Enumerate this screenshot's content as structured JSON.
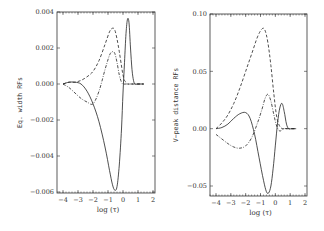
{
  "chart_data": [
    {
      "type": "line",
      "title": "",
      "xlabel": "log (τ)",
      "ylabel": "Eq. width RFs",
      "xlim": [
        -4.4,
        2
      ],
      "ylim": [
        -0.006,
        0.004
      ],
      "xticks": [
        -4,
        -3,
        -2,
        -1,
        0,
        1,
        2
      ],
      "xtick_labels": [
        "−4",
        "−3",
        "−2",
        "−1",
        "0",
        "1",
        "2"
      ],
      "yticks": [
        0.004,
        0.002,
        0.0,
        -0.002,
        -0.004,
        -0.006
      ],
      "ytick_labels": [
        "0.004",
        "0.002",
        "0.000",
        "−0.002",
        "−0.004",
        "−0.006"
      ],
      "grid": false,
      "legend": null,
      "series": [
        {
          "name": "solid",
          "style": "solid",
          "x": [
            -4.0,
            -3.6,
            -3.2,
            -2.8,
            -2.4,
            -2.0,
            -1.6,
            -1.2,
            -0.9,
            -0.7,
            -0.55,
            -0.4,
            -0.25,
            -0.1,
            0.0,
            0.1,
            0.2,
            0.3,
            0.4,
            0.5,
            0.6,
            0.7,
            0.8,
            1.0,
            1.2,
            1.4
          ],
          "y": [
            0.0,
            0.0001,
            0.0001,
            0.0,
            -0.0004,
            -0.0011,
            -0.0021,
            -0.0035,
            -0.0048,
            -0.0056,
            -0.0059,
            -0.0057,
            -0.0045,
            -0.0025,
            -0.0005,
            0.0012,
            0.0028,
            0.0036,
            0.0034,
            0.002,
            0.0008,
            0.0002,
            0.0,
            0.0,
            0.0,
            0.0
          ]
        },
        {
          "name": "dashed",
          "style": "dashed",
          "x": [
            -4.0,
            -3.6,
            -3.2,
            -2.8,
            -2.4,
            -2.0,
            -1.6,
            -1.2,
            -0.9,
            -0.7,
            -0.55,
            -0.4,
            -0.25,
            -0.1,
            0.0,
            0.1,
            0.2,
            0.3,
            0.5,
            0.7,
            1.0,
            1.4
          ],
          "y": [
            0.0,
            0.0001,
            0.0001,
            0.0002,
            0.0004,
            0.0007,
            0.0013,
            0.0022,
            0.0029,
            0.0031,
            0.003,
            0.0025,
            0.0018,
            0.001,
            0.0005,
            0.0002,
            0.0001,
            0.0,
            0.0,
            0.0,
            0.0,
            0.0
          ]
        },
        {
          "name": "dash-dot",
          "style": "dash-dot",
          "x": [
            -4.0,
            -3.6,
            -3.2,
            -2.8,
            -2.4,
            -2.0,
            -1.6,
            -1.2,
            -0.9,
            -0.7,
            -0.55,
            -0.4,
            -0.25,
            -0.1,
            0.0,
            0.2,
            0.4,
            0.6,
            1.0,
            1.4
          ],
          "y": [
            0.0,
            -0.0002,
            -0.0005,
            -0.0008,
            -0.001,
            -0.0011,
            -0.0004,
            0.0008,
            0.0016,
            0.0018,
            0.0017,
            0.0012,
            0.0005,
            0.0001,
            0.0,
            0.0,
            0.0,
            0.0,
            0.0,
            0.0
          ]
        }
      ]
    },
    {
      "type": "line",
      "title": "",
      "xlabel": "log (τ)",
      "ylabel": "V−peak distance RFs",
      "xlim": [
        -4.4,
        2
      ],
      "ylim": [
        -0.06,
        0.1
      ],
      "xticks": [
        -4,
        -3,
        -2,
        -1,
        0,
        1,
        2
      ],
      "xtick_labels": [
        "−4",
        "−3",
        "−2",
        "−1",
        "0",
        "1",
        "2"
      ],
      "yticks": [
        0.1,
        0.05,
        0.0,
        -0.05
      ],
      "ytick_labels": [
        "0.10",
        "0.05",
        "0.00",
        "−0.05"
      ],
      "grid": false,
      "legend": null,
      "series": [
        {
          "name": "solid",
          "style": "solid",
          "x": [
            -4.0,
            -3.6,
            -3.2,
            -2.8,
            -2.4,
            -2.0,
            -1.7,
            -1.4,
            -1.1,
            -0.8,
            -0.6,
            -0.45,
            -0.3,
            -0.15,
            0.0,
            0.15,
            0.3,
            0.45,
            0.6,
            0.75,
            0.9,
            1.1,
            1.4
          ],
          "y": [
            0.0,
            0.001,
            0.004,
            0.009,
            0.013,
            0.014,
            0.009,
            -0.005,
            -0.025,
            -0.045,
            -0.055,
            -0.056,
            -0.05,
            -0.035,
            -0.015,
            0.005,
            0.018,
            0.022,
            0.015,
            0.004,
            0.0,
            0.0,
            0.0
          ]
        },
        {
          "name": "dashed",
          "style": "dashed",
          "x": [
            -4.0,
            -3.6,
            -3.2,
            -2.8,
            -2.4,
            -2.0,
            -1.6,
            -1.2,
            -0.9,
            -0.7,
            -0.5,
            -0.3,
            -0.1,
            0.1,
            0.3,
            0.5,
            0.8,
            1.1,
            1.4
          ],
          "y": [
            0.0,
            0.005,
            0.012,
            0.022,
            0.035,
            0.05,
            0.065,
            0.08,
            0.087,
            0.086,
            0.075,
            0.055,
            0.03,
            0.01,
            0.002,
            0.0,
            0.0,
            0.0,
            0.0
          ]
        },
        {
          "name": "dash-dot",
          "style": "dash-dot",
          "x": [
            -4.0,
            -3.6,
            -3.2,
            -2.8,
            -2.4,
            -2.0,
            -1.6,
            -1.2,
            -0.9,
            -0.7,
            -0.5,
            -0.3,
            -0.1,
            0.1,
            0.3,
            0.6,
            1.0,
            1.4
          ],
          "y": [
            -0.005,
            -0.009,
            -0.013,
            -0.016,
            -0.017,
            -0.015,
            -0.008,
            0.005,
            0.017,
            0.026,
            0.03,
            0.024,
            0.012,
            0.002,
            -0.002,
            0.0,
            0.0,
            0.0
          ]
        }
      ]
    }
  ],
  "panels": [
    {
      "ylabel": "Eq. width RFs",
      "xlabel": "log (τ)",
      "frame": {
        "left": 57,
        "top": 12,
        "right": 155,
        "bottom": 193
      },
      "xmap": {
        "x0": -4,
        "px0": 63,
        "x1": 2,
        "px1": 153
      },
      "ymap": {
        "y0": 0.004,
        "py0": 12,
        "y1": -0.006,
        "py1": 192
      }
    },
    {
      "ylabel": "V−peak distance RFs",
      "xlabel": "log (τ)",
      "frame": {
        "left": 210,
        "top": 14,
        "right": 307,
        "bottom": 196
      },
      "xmap": {
        "x0": -4,
        "px0": 216,
        "x1": 2,
        "px1": 305
      },
      "ymap": {
        "y0": 0.1,
        "py0": 14,
        "y1": -0.05,
        "py1": 186
      }
    }
  ],
  "colors": {
    "line": "#222222",
    "frame": "#333333",
    "text": "#333333"
  }
}
